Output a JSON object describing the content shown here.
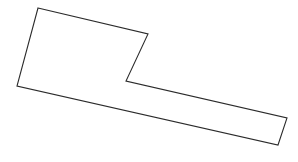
{
  "canvas": {
    "width": 298,
    "height": 162,
    "background_color": "#ffffff"
  },
  "figure": {
    "name": "l-shaped-polygon",
    "stroke_color": "#2b2b2b",
    "fill_color": "#ffffff",
    "stroke_width": 1.1,
    "vertex_count": 6,
    "closed": true,
    "points": "38,8 148,34 126,81 287,118 278,145 17,86",
    "vertices": [
      {
        "label": "top-left",
        "x": 38,
        "y": 8
      },
      {
        "label": "notch-top-right",
        "x": 148,
        "y": 34
      },
      {
        "label": "notch-inner",
        "x": 126,
        "y": 81
      },
      {
        "label": "tail-top-right",
        "x": 287,
        "y": 118
      },
      {
        "label": "tail-bottom-right",
        "x": 278,
        "y": 145
      },
      {
        "label": "bottom-left",
        "x": 17,
        "y": 86
      }
    ]
  }
}
